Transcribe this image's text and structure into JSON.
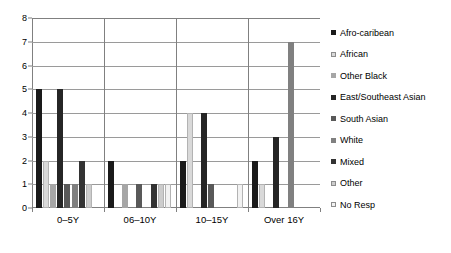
{
  "chart_data": {
    "type": "bar",
    "title": "",
    "subtitle": "",
    "xlabel": "",
    "ylabel": "",
    "ylim": [
      0,
      8
    ],
    "yticks": [
      0,
      1,
      2,
      3,
      4,
      5,
      6,
      7,
      8
    ],
    "grid": true,
    "legend_position": "right",
    "categories": [
      "0–5Y",
      "06–10Y",
      "10–15Y",
      "Over 16Y"
    ],
    "series": [
      {
        "name": "Afro-caribean",
        "color": "#1a1a1a",
        "values": [
          5,
          2,
          2,
          2
        ]
      },
      {
        "name": "African",
        "color": "#d9d9d9",
        "values": [
          2,
          0,
          4,
          1
        ]
      },
      {
        "name": "Other Black",
        "color": "#a6a6a6",
        "values": [
          1,
          1,
          0,
          0
        ]
      },
      {
        "name": "East/Southeast Asian",
        "color": "#262626",
        "values": [
          5,
          0,
          4,
          3
        ]
      },
      {
        "name": "South Asian",
        "color": "#595959",
        "values": [
          1,
          1,
          1,
          0
        ]
      },
      {
        "name": "White",
        "color": "#808080",
        "values": [
          1,
          0,
          0,
          7
        ]
      },
      {
        "name": "Mixed",
        "color": "#333333",
        "values": [
          2,
          1,
          0,
          0
        ]
      },
      {
        "name": "Other",
        "color": "#cccccc",
        "values": [
          1,
          1,
          0,
          0
        ]
      },
      {
        "name": "No Resp",
        "color": "#f2f2f2",
        "values": [
          0,
          1,
          1,
          0
        ]
      }
    ]
  },
  "legend": {
    "items": [
      {
        "label": "Afro-caribean"
      },
      {
        "label": "African"
      },
      {
        "label": "Other Black"
      },
      {
        "label": "East/Southeast Asian"
      },
      {
        "label": "South Asian"
      },
      {
        "label": "White"
      },
      {
        "label": "Mixed"
      },
      {
        "label": "Other"
      },
      {
        "label": "No Resp"
      }
    ]
  },
  "axes": {
    "y_tick_labels": [
      "0",
      "1",
      "2",
      "3",
      "4",
      "5",
      "6",
      "7",
      "8"
    ],
    "x_tick_labels": [
      "0–5Y",
      "06–10Y",
      "10–15Y",
      "Over 16Y"
    ]
  }
}
